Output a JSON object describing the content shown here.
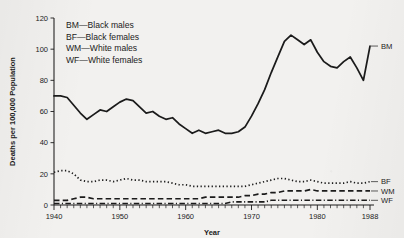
{
  "chart_data": {
    "type": "line",
    "title": "",
    "xlabel": "Year",
    "ylabel": "Deaths per 100,000 Population",
    "xlim": [
      1940,
      1988
    ],
    "ylim": [
      0,
      120
    ],
    "yticks": [
      0,
      20,
      40,
      60,
      80,
      100,
      120
    ],
    "xticks": [
      1940,
      1950,
      1960,
      1970,
      1980,
      1988
    ],
    "grid": false,
    "legend_position": "upper-left inside",
    "minor_tick_interval": 1,
    "legend": [
      {
        "key": "BM",
        "label": "BM—Black males"
      },
      {
        "key": "BF",
        "label": "BF—Black females"
      },
      {
        "key": "WM",
        "label": "WM—White males"
      },
      {
        "key": "WF",
        "label": "WF—White females"
      }
    ],
    "end_labels": [
      {
        "key": "BM",
        "text": "BM",
        "value": 102
      },
      {
        "key": "BF",
        "text": "BF",
        "value": 15
      },
      {
        "key": "WM",
        "text": "WM",
        "value": 9
      },
      {
        "key": "WF",
        "text": "WF",
        "value": 3
      }
    ],
    "x": [
      1940,
      1941,
      1942,
      1943,
      1944,
      1945,
      1946,
      1947,
      1948,
      1949,
      1950,
      1951,
      1952,
      1953,
      1954,
      1955,
      1956,
      1957,
      1958,
      1959,
      1960,
      1961,
      1962,
      1963,
      1964,
      1965,
      1966,
      1967,
      1968,
      1969,
      1970,
      1971,
      1972,
      1973,
      1974,
      1975,
      1976,
      1977,
      1978,
      1979,
      1980,
      1981,
      1982,
      1983,
      1984,
      1985,
      1986,
      1987,
      1988
    ],
    "series": [
      {
        "name": "BM",
        "label": "Black males",
        "style": "solid",
        "values": [
          70,
          70,
          69,
          64,
          59,
          55,
          58,
          61,
          60,
          63,
          66,
          68,
          67,
          63,
          59,
          60,
          57,
          55,
          56,
          52,
          49,
          46,
          48,
          46,
          47,
          48,
          46,
          46,
          47,
          50,
          57,
          65,
          74,
          85,
          95,
          105,
          109,
          106,
          103,
          106,
          98,
          92,
          89,
          88,
          92,
          95,
          88,
          80,
          102
        ]
      },
      {
        "name": "BF",
        "label": "Black females",
        "style": "dotted",
        "values": [
          21,
          22,
          22,
          20,
          16,
          15,
          15,
          16,
          16,
          15,
          16,
          17,
          16,
          16,
          15,
          15,
          15,
          15,
          14,
          13,
          13,
          12,
          12,
          12,
          12,
          12,
          12,
          12,
          12,
          12,
          13,
          14,
          15,
          16,
          17,
          17,
          16,
          15,
          15,
          16,
          15,
          14,
          14,
          14,
          14,
          15,
          14,
          14,
          15
        ]
      },
      {
        "name": "WM",
        "label": "White males",
        "style": "dashed",
        "values": [
          3,
          3,
          3,
          4,
          5,
          5,
          4,
          4,
          4,
          4,
          4,
          4,
          4,
          4,
          4,
          4,
          4,
          4,
          4,
          4,
          4,
          4,
          4,
          5,
          5,
          5,
          5,
          5,
          5,
          6,
          6,
          7,
          7,
          8,
          8,
          9,
          9,
          9,
          9,
          10,
          9,
          9,
          9,
          9,
          9,
          9,
          9,
          9,
          9
        ]
      },
      {
        "name": "WF",
        "label": "White females",
        "style": "dash-dot",
        "values": [
          1,
          1,
          1,
          1,
          1,
          1,
          1,
          1,
          1,
          1,
          1,
          1,
          1,
          1,
          1,
          1,
          1,
          1,
          1,
          1,
          1,
          1,
          1,
          1,
          1,
          1,
          1,
          2,
          2,
          2,
          2,
          2,
          2,
          3,
          3,
          3,
          3,
          3,
          3,
          3,
          3,
          3,
          3,
          3,
          3,
          3,
          3,
          3,
          3
        ]
      }
    ]
  },
  "colors": {
    "ink": "#1b1b1b",
    "paper": "#f2f1ef"
  }
}
